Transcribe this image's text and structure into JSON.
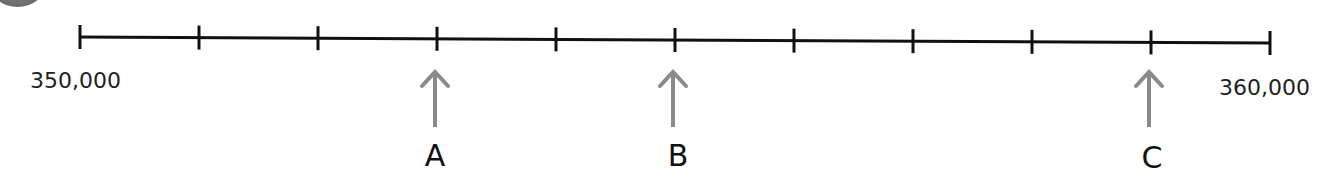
{
  "chart_data": {
    "type": "number-line",
    "title": "",
    "range": [
      350000,
      360000
    ],
    "tick_interval": 1000,
    "ticks": [
      350000,
      351000,
      352000,
      353000,
      354000,
      355000,
      356000,
      357000,
      358000,
      359000,
      360000
    ],
    "end_labels": {
      "start": "350,000",
      "end": "360,000"
    },
    "markers": [
      {
        "label": "A",
        "value": 353000
      },
      {
        "label": "B",
        "value": 355000
      },
      {
        "label": "C",
        "value": 359000
      }
    ]
  },
  "labels": {
    "start": "350,000",
    "end": "360,000",
    "A": "A",
    "B": "B",
    "C": "C"
  },
  "colors": {
    "line": "#111111",
    "arrow": "#8a8a8a",
    "text": "#222222"
  }
}
